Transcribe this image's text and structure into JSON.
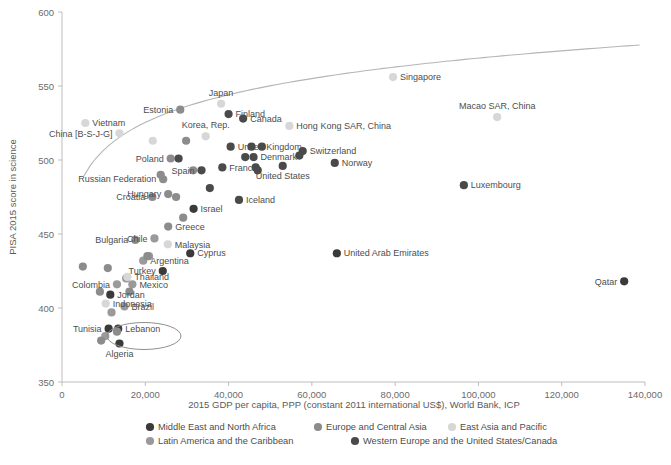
{
  "chart_data": {
    "type": "scatter",
    "title": "",
    "xlabel": "2015 GDP per capita, PPP (constant 2011 international US$), World Bank, ICP",
    "ylabel": "PISA 2015 score in science",
    "xlim": [
      0,
      140000
    ],
    "ylim": [
      350,
      600
    ],
    "xticks": [
      0,
      20000,
      40000,
      60000,
      80000,
      100000,
      120000,
      140000
    ],
    "xtick_labels": [
      "0",
      "20,000",
      "40,000",
      "60,000",
      "80,000",
      "100,000",
      "120,000",
      "140,000"
    ],
    "yticks": [
      350,
      400,
      450,
      500,
      550,
      600
    ],
    "ytick_labels": [
      "350",
      "400",
      "450",
      "500",
      "550",
      "600"
    ],
    "grid": false,
    "legend_position": "bottom",
    "trendline": {
      "present": true,
      "description": "logarithmic fit curve rising from lower-left to upper-right",
      "color": "#b5b5b5"
    },
    "annotation": {
      "type": "ellipse",
      "label": "Lebanon",
      "description": "oval highlight drawn around the Lebanon label"
    },
    "series": [
      {
        "name": "Middle East and North Africa",
        "color": "#3a3a3a",
        "points": [
          {
            "label": "Qatar",
            "x": 135000,
            "y": 418,
            "label_pos": "left"
          },
          {
            "label": "United Arab Emirates",
            "x": 66000,
            "y": 437,
            "label_pos": "right"
          },
          {
            "label": "Lebanon",
            "x": 13500,
            "y": 386,
            "label_pos": "right"
          },
          {
            "label": "Algeria",
            "x": 13800,
            "y": 376,
            "label_pos": "below"
          },
          {
            "label": "Tunisia",
            "x": 11200,
            "y": 386,
            "label_pos": "left"
          },
          {
            "label": "Jordan",
            "x": 11600,
            "y": 409,
            "label_pos": "right"
          },
          {
            "label": "Turkey",
            "x": 24200,
            "y": 425,
            "label_pos": "left"
          },
          {
            "label": "Israel",
            "x": 31600,
            "y": 467,
            "label_pos": "right"
          },
          {
            "label": "Cyprus",
            "x": 30800,
            "y": 437,
            "label_pos": "right"
          }
        ]
      },
      {
        "name": "Latin America and the Caribbean",
        "color": "#9a9a9a",
        "points": [
          {
            "label": "Colombia",
            "x": 13200,
            "y": 416,
            "label_pos": "left"
          },
          {
            "label": "Mexico",
            "x": 16900,
            "y": 416,
            "label_pos": "right"
          },
          {
            "label": "Brazil",
            "x": 15000,
            "y": 401,
            "label_pos": "right"
          },
          {
            "label": "Chile",
            "x": 22200,
            "y": 447,
            "label_pos": "left"
          },
          {
            "label": "Argentina",
            "x": 19500,
            "y": 432,
            "label_pos": "right"
          },
          {
            "label": "Uruguay",
            "x": 20900,
            "y": 435,
            "label_pos": "none"
          },
          {
            "label": "Costa Rica",
            "x": 15400,
            "y": 420,
            "label_pos": "none"
          },
          {
            "label": "Peru",
            "x": 11900,
            "y": 397,
            "label_pos": "none"
          },
          {
            "label": "Dominican Republic",
            "x": 13900,
            "y": 332,
            "label_pos": "none"
          },
          {
            "label": "Trinidad",
            "x": 10400,
            "y": 381,
            "label_pos": "none"
          }
        ]
      },
      {
        "name": "Europe and Central Asia",
        "color": "#8c8c8c",
        "points": [
          {
            "label": "Estonia",
            "x": 28400,
            "y": 534,
            "label_pos": "left"
          },
          {
            "label": "Poland",
            "x": 26100,
            "y": 501,
            "label_pos": "left"
          },
          {
            "label": "Russian Federation",
            "x": 24300,
            "y": 487,
            "label_pos": "left"
          },
          {
            "label": "Croatia",
            "x": 21700,
            "y": 475,
            "label_pos": "left"
          },
          {
            "label": "Hungary",
            "x": 25500,
            "y": 477,
            "label_pos": "left"
          },
          {
            "label": "Bulgaria",
            "x": 17600,
            "y": 446,
            "label_pos": "left"
          },
          {
            "label": "Greece",
            "x": 25500,
            "y": 455,
            "label_pos": "right"
          },
          {
            "label": "Slovenia",
            "x": 29800,
            "y": 513,
            "label_pos": "none"
          },
          {
            "label": "Czech Republic",
            "x": 31500,
            "y": 493,
            "label_pos": "none"
          },
          {
            "label": "Slovak Republic",
            "x": 29100,
            "y": 461,
            "label_pos": "none"
          },
          {
            "label": "Latvia",
            "x": 23700,
            "y": 490,
            "label_pos": "none"
          },
          {
            "label": "Lithuania",
            "x": 27400,
            "y": 475,
            "label_pos": "none"
          },
          {
            "label": "Romania",
            "x": 20500,
            "y": 435,
            "label_pos": "none"
          },
          {
            "label": "Montenegro",
            "x": 16200,
            "y": 411,
            "label_pos": "none"
          },
          {
            "label": "Georgia",
            "x": 9100,
            "y": 411,
            "label_pos": "none"
          },
          {
            "label": "Kosovo",
            "x": 9400,
            "y": 378,
            "label_pos": "none"
          },
          {
            "label": "Albania",
            "x": 11000,
            "y": 427,
            "label_pos": "none"
          },
          {
            "label": "Macedonia",
            "x": 13200,
            "y": 384,
            "label_pos": "none"
          },
          {
            "label": "Moldova",
            "x": 5000,
            "y": 428,
            "label_pos": "none"
          }
        ]
      },
      {
        "name": "East Asia and Pacific",
        "color": "#d7d7d7",
        "points": [
          {
            "label": "Singapore",
            "x": 79500,
            "y": 556,
            "label_pos": "right"
          },
          {
            "label": "Japan",
            "x": 38200,
            "y": 538,
            "label_pos": "above"
          },
          {
            "label": "Macao SAR, China",
            "x": 104500,
            "y": 529,
            "label_pos": "above"
          },
          {
            "label": "Hong Kong SAR, China",
            "x": 54600,
            "y": 523,
            "label_pos": "right"
          },
          {
            "label": "Vietnam",
            "x": 5600,
            "y": 525,
            "label_pos": "right"
          },
          {
            "label": "China [B-S-J-G]",
            "x": 13800,
            "y": 518,
            "label_pos": "left"
          },
          {
            "label": "Korea, Rep.",
            "x": 34500,
            "y": 516,
            "label_pos": "above"
          },
          {
            "label": "Chinese Taipei",
            "x": 21800,
            "y": 513,
            "label_pos": "none"
          },
          {
            "label": "Malaysia",
            "x": 25400,
            "y": 443,
            "label_pos": "right"
          },
          {
            "label": "Thailand",
            "x": 15700,
            "y": 421,
            "label_pos": "right"
          },
          {
            "label": "Indonesia",
            "x": 10500,
            "y": 403,
            "label_pos": "right"
          }
        ]
      },
      {
        "name": "Western Europe and the United States/Canada",
        "color": "#4a4a4a",
        "points": [
          {
            "label": "Finland",
            "x": 40000,
            "y": 531,
            "label_pos": "right"
          },
          {
            "label": "Canada",
            "x": 43500,
            "y": 528,
            "label_pos": "right"
          },
          {
            "label": "United Kingdom",
            "x": 40500,
            "y": 509,
            "label_pos": "right"
          },
          {
            "label": "Switzerland",
            "x": 57800,
            "y": 506,
            "label_pos": "right"
          },
          {
            "label": "Denmark",
            "x": 46000,
            "y": 502,
            "label_pos": "right"
          },
          {
            "label": "France",
            "x": 38500,
            "y": 495,
            "label_pos": "right"
          },
          {
            "label": "United States",
            "x": 53000,
            "y": 496,
            "label_pos": "below"
          },
          {
            "label": "Norway",
            "x": 65500,
            "y": 498,
            "label_pos": "right"
          },
          {
            "label": "Luxembourg",
            "x": 96500,
            "y": 483,
            "label_pos": "right"
          },
          {
            "label": "Spain",
            "x": 33500,
            "y": 493,
            "label_pos": "left"
          },
          {
            "label": "Iceland",
            "x": 42500,
            "y": 473,
            "label_pos": "right"
          },
          {
            "label": "Germany",
            "x": 45500,
            "y": 509,
            "label_pos": "none"
          },
          {
            "label": "Netherlands",
            "x": 48000,
            "y": 509,
            "label_pos": "none"
          },
          {
            "label": "Ireland",
            "x": 57000,
            "y": 503,
            "label_pos": "none"
          },
          {
            "label": "Belgium",
            "x": 44000,
            "y": 502,
            "label_pos": "none"
          },
          {
            "label": "Portugal",
            "x": 28000,
            "y": 501,
            "label_pos": "none"
          },
          {
            "label": "Austria",
            "x": 46500,
            "y": 495,
            "label_pos": "none"
          },
          {
            "label": "Sweden",
            "x": 47000,
            "y": 493,
            "label_pos": "none"
          },
          {
            "label": "Italy",
            "x": 35500,
            "y": 481,
            "label_pos": "none"
          }
        ]
      }
    ]
  },
  "axes": {
    "x_title": "2015 GDP per capita, PPP (constant 2011 international US$), World Bank, ICP",
    "y_title": "PISA 2015 score in science"
  },
  "legend": {
    "entries": [
      {
        "label": "Middle East and North Africa",
        "color": "#3a3a3a"
      },
      {
        "label": "Europe and Central Asia",
        "color": "#8c8c8c"
      },
      {
        "label": "East Asia and Pacific",
        "color": "#d7d7d7"
      },
      {
        "label": "Latin America and the Caribbean",
        "color": "#9a9a9a"
      },
      {
        "label": "Western Europe and the United States/Canada",
        "color": "#4a4a4a"
      }
    ]
  },
  "ticks": {
    "x": [
      "0",
      "20,000",
      "40,000",
      "60,000",
      "80,000",
      "100,000",
      "120,000",
      "140,000"
    ],
    "y": [
      "600",
      "550",
      "500",
      "450",
      "400",
      "350"
    ]
  }
}
